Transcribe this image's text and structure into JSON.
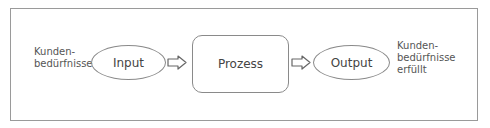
{
  "diagram": {
    "left_label": [
      "Kunden-",
      "bedürfnisse"
    ],
    "input": "Input",
    "process": "Prozess",
    "output": "Output",
    "right_label": [
      "Kunden-",
      "bedürfnisse",
      "erfüllt"
    ],
    "arrow_icon": "hollow-right-arrow"
  }
}
